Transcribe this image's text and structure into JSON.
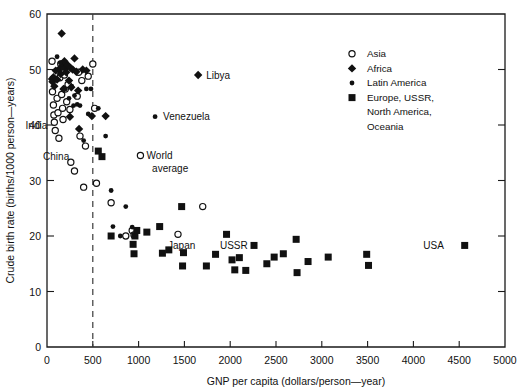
{
  "chart_data": {
    "type": "scatter",
    "title": "",
    "xlabel": "GNP per capita (dollars/person—year)",
    "ylabel": "Crude birth rate (births/1000 person—years)",
    "xlim": [
      0,
      5000
    ],
    "ylim": [
      0,
      60
    ],
    "xticks": [
      0,
      500,
      1000,
      1500,
      2000,
      2500,
      3000,
      3500,
      4000,
      4500,
      5000
    ],
    "yticks": [
      0,
      10,
      20,
      30,
      40,
      50,
      60
    ],
    "xticklabels": [
      "0",
      "500",
      "1000",
      "1500",
      "2000",
      "2500",
      "3000",
      "3500",
      "4000",
      "4500",
      "5000"
    ],
    "yticklabels": [
      "0",
      "10",
      "20",
      "30",
      "40",
      "50",
      "60"
    ],
    "grid": false,
    "legend_position": "upper-right-inside",
    "reference_lines": [
      {
        "orientation": "vertical",
        "value": 500,
        "style": "dashed"
      }
    ],
    "annotations": [
      {
        "text": "Libya",
        "x": 1650,
        "y": 49.0,
        "anchor": "right-of-point"
      },
      {
        "text": "Venezuela",
        "x": 1180,
        "y": 41.5,
        "anchor": "right-of-point"
      },
      {
        "text": "India",
        "x": 90,
        "y": 40.0,
        "anchor": "left-of-point"
      },
      {
        "text": "China",
        "x": 330,
        "y": 34.3,
        "anchor": "left-of-point"
      },
      {
        "text": "World",
        "x": 1000,
        "y": 34.5,
        "anchor": "right-of-point"
      },
      {
        "text": "average",
        "x": 1060,
        "y": 32.2,
        "anchor": "right-of-point"
      },
      {
        "text": "Japan",
        "x": 1470,
        "y": 18.3,
        "anchor": "above-point"
      },
      {
        "text": "USSR",
        "x": 2040,
        "y": 18.3,
        "anchor": "above-point"
      },
      {
        "text": "USA",
        "x": 4420,
        "y": 18.3,
        "anchor": "left-of-point"
      }
    ],
    "series": [
      {
        "name": "Asia",
        "marker": "open-circle",
        "points": [
          [
            55,
            51.5
          ],
          [
            60,
            46.0
          ],
          [
            70,
            43.6
          ],
          [
            75,
            41.8
          ],
          [
            80,
            40.5
          ],
          [
            90,
            39.0
          ],
          [
            110,
            44.8
          ],
          [
            120,
            42.2
          ],
          [
            130,
            37.6
          ],
          [
            140,
            48.5
          ],
          [
            150,
            51.0
          ],
          [
            160,
            45.5
          ],
          [
            170,
            43.0
          ],
          [
            175,
            41.0
          ],
          [
            190,
            49.0
          ],
          [
            200,
            46.5
          ],
          [
            215,
            44.2
          ],
          [
            230,
            47.3
          ],
          [
            250,
            42.8
          ],
          [
            260,
            33.3
          ],
          [
            300,
            31.7
          ],
          [
            330,
            45.2
          ],
          [
            345,
            49.5
          ],
          [
            360,
            38.0
          ],
          [
            380,
            48.0
          ],
          [
            400,
            28.8
          ],
          [
            420,
            36.2
          ],
          [
            450,
            48.8
          ],
          [
            500,
            51.0
          ],
          [
            520,
            43.0
          ],
          [
            540,
            29.5
          ],
          [
            700,
            26.0
          ],
          [
            860,
            20.0
          ],
          [
            930,
            21.0
          ],
          [
            950,
            20.2
          ],
          [
            1020,
            34.5
          ],
          [
            1430,
            20.3
          ],
          [
            1700,
            25.3
          ]
        ]
      },
      {
        "name": "Africa",
        "marker": "diamond",
        "points": [
          [
            55,
            48.3
          ],
          [
            60,
            47.8
          ],
          [
            70,
            48.6
          ],
          [
            80,
            47.0
          ],
          [
            95,
            49.8
          ],
          [
            110,
            48.2
          ],
          [
            130,
            50.0
          ],
          [
            150,
            49.2
          ],
          [
            165,
            50.6
          ],
          [
            180,
            46.5
          ],
          [
            190,
            51.5
          ],
          [
            200,
            50.2
          ],
          [
            210,
            49.5
          ],
          [
            225,
            50.8
          ],
          [
            240,
            48.0
          ],
          [
            250,
            41.5
          ],
          [
            255,
            50.3
          ],
          [
            265,
            46.8
          ],
          [
            280,
            50.0
          ],
          [
            300,
            52.0
          ],
          [
            320,
            49.6
          ],
          [
            340,
            46.2
          ],
          [
            350,
            39.3
          ],
          [
            390,
            50.0
          ],
          [
            430,
            49.8
          ],
          [
            160,
            56.5
          ],
          [
            490,
            41.6
          ],
          [
            640,
            41.6
          ],
          [
            1650,
            49.0
          ]
        ]
      },
      {
        "name": "Latin America",
        "marker": "small-filled-circle",
        "points": [
          [
            110,
            52.3
          ],
          [
            145,
            51.2
          ],
          [
            170,
            50.2
          ],
          [
            200,
            46.5
          ],
          [
            240,
            44.8
          ],
          [
            270,
            47.0
          ],
          [
            290,
            43.5
          ],
          [
            300,
            45.3
          ],
          [
            330,
            43.7
          ],
          [
            360,
            43.5
          ],
          [
            400,
            37.2
          ],
          [
            430,
            46.5
          ],
          [
            450,
            42.0
          ],
          [
            480,
            46.5
          ],
          [
            560,
            43.0
          ],
          [
            600,
            34.2
          ],
          [
            640,
            38.0
          ],
          [
            700,
            28.2
          ],
          [
            720,
            21.7
          ],
          [
            800,
            20.0
          ],
          [
            930,
            21.6
          ],
          [
            950,
            20.0
          ],
          [
            1180,
            41.5
          ],
          [
            860,
            25.3
          ]
        ]
      },
      {
        "name": "Europe, USSR, North America, Oceania",
        "marker": "filled-square",
        "points": [
          [
            560,
            35.3
          ],
          [
            600,
            34.3
          ],
          [
            700,
            20.0
          ],
          [
            940,
            18.5
          ],
          [
            950,
            16.8
          ],
          [
            960,
            20.0
          ],
          [
            980,
            21.0
          ],
          [
            1090,
            20.7
          ],
          [
            1230,
            21.7
          ],
          [
            1260,
            16.9
          ],
          [
            1330,
            17.5
          ],
          [
            1470,
            25.3
          ],
          [
            1480,
            14.6
          ],
          [
            1490,
            17.0
          ],
          [
            1740,
            14.6
          ],
          [
            1840,
            16.7
          ],
          [
            1960,
            20.3
          ],
          [
            2020,
            15.7
          ],
          [
            2050,
            13.9
          ],
          [
            2100,
            16.1
          ],
          [
            2170,
            13.8
          ],
          [
            2260,
            18.3
          ],
          [
            2400,
            15.0
          ],
          [
            2480,
            16.2
          ],
          [
            2580,
            16.8
          ],
          [
            2720,
            19.4
          ],
          [
            2730,
            13.4
          ],
          [
            2850,
            15.4
          ],
          [
            3070,
            16.2
          ],
          [
            3490,
            16.7
          ],
          [
            3510,
            14.7
          ],
          [
            4560,
            18.3
          ]
        ]
      }
    ]
  },
  "legend": {
    "entries": [
      {
        "label": "Asia",
        "marker": "open-circle"
      },
      {
        "label": "Africa",
        "marker": "diamond"
      },
      {
        "label": "Latin America",
        "marker": "small-filled-circle"
      },
      {
        "label": "Europe, USSR,",
        "marker": "filled-square"
      },
      {
        "label": "North America,",
        "marker": "none"
      },
      {
        "label": "Oceania",
        "marker": "none"
      }
    ]
  }
}
